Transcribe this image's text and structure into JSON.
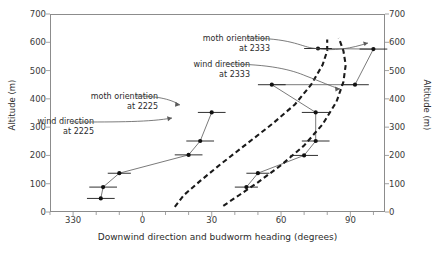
{
  "figure": {
    "clipped_header": "",
    "background": "#ffffff"
  },
  "axes": {
    "x": {
      "title": "Downwind direction and budworm heading (degrees)",
      "ticks": [
        "330",
        "0",
        "30",
        "60",
        "90"
      ],
      "tick_values": [
        -30,
        0,
        30,
        60,
        90
      ],
      "minor_step": 10,
      "min": -40,
      "max": 105
    },
    "y_left": {
      "title": "Altitude (m)",
      "ticks": [
        "0",
        "100",
        "200",
        "300",
        "400",
        "500",
        "600",
        "700"
      ],
      "tick_values": [
        0,
        100,
        200,
        300,
        400,
        500,
        600,
        700
      ],
      "min": 0,
      "max": 700
    },
    "y_right": {
      "title": "Altitude (m)",
      "ticks": [
        "0",
        "100",
        "200",
        "300",
        "400",
        "500",
        "600",
        "700"
      ],
      "tick_values": [
        0,
        100,
        200,
        300,
        400,
        500,
        600,
        700
      ],
      "min": 0,
      "max": 700
    }
  },
  "annotations": [
    {
      "name": "moth-orientation-2333",
      "line1": "moth orientation",
      "line2": "at 2333"
    },
    {
      "name": "wind-direction-2333",
      "line1": "wind direction",
      "line2": "at 2333"
    },
    {
      "name": "moth-orientation-2225",
      "line1": "moth orientation",
      "line2": "at 2225"
    },
    {
      "name": "wind-direction-2225",
      "line1": "wind direction",
      "line2": "at 2225"
    }
  ],
  "chart_data": {
    "type": "scatter",
    "title": "",
    "xlabel": "Downwind direction and budworm heading (degrees)",
    "ylabel": "Altitude (m)",
    "xlim": [
      -40,
      105
    ],
    "ylim": [
      0,
      700
    ],
    "xticks": [
      -30,
      0,
      30,
      60,
      90
    ],
    "xticklabels": [
      "330",
      "0",
      "30",
      "60",
      "90"
    ],
    "yticks": [
      0,
      100,
      200,
      300,
      400,
      500,
      600,
      700
    ],
    "grid": false,
    "legend": "annotations-inline",
    "series": [
      {
        "name": "moth orientation at 2225",
        "style": "markers-with-errorbars-and-thin-line",
        "marker": "filled-circle",
        "line": "solid-thin",
        "points": [
          {
            "x": -18,
            "y": 48,
            "xerr": 6
          },
          {
            "x": -17,
            "y": 88,
            "xerr": 6
          },
          {
            "x": -10,
            "y": 137,
            "xerr": 5
          },
          {
            "x": 20,
            "y": 202,
            "xerr": 6
          },
          {
            "x": 25,
            "y": 251,
            "xerr": 6
          },
          {
            "x": 30,
            "y": 352,
            "xerr": 6
          }
        ]
      },
      {
        "name": "moth orientation at 2333",
        "style": "markers-with-errorbars-and-thin-line",
        "marker": "filled-circle",
        "line": "solid-thin",
        "points": [
          {
            "x": 45,
            "y": 88,
            "xerr": 5
          },
          {
            "x": 50,
            "y": 137,
            "xerr": 5
          },
          {
            "x": 70,
            "y": 200,
            "xerr": 6
          },
          {
            "x": 75,
            "y": 251,
            "xerr": 6
          },
          {
            "x": 75,
            "y": 352,
            "xerr": 6
          },
          {
            "x": 56,
            "y": 450,
            "xerr": 6
          },
          {
            "x": 92,
            "y": 450,
            "xerr": 6
          },
          {
            "x": 76,
            "y": 578,
            "xerr": 6
          },
          {
            "x": 100,
            "y": 576,
            "xerr": 6
          }
        ]
      },
      {
        "name": "wind direction at 2225",
        "style": "dashed-curve",
        "line": "dashed-thick",
        "x": [
          14,
          18,
          25,
          34,
          45,
          56,
          66,
          73,
          78,
          80,
          80
        ],
        "y": [
          18,
          60,
          110,
          170,
          240,
          310,
          380,
          450,
          520,
          570,
          610
        ]
      },
      {
        "name": "wind direction at 2333",
        "style": "dashed-curve",
        "line": "dashed-thick",
        "x": [
          35,
          42,
          50,
          60,
          70,
          78,
          84,
          87,
          88,
          87,
          85
        ],
        "y": [
          22,
          60,
          105,
          165,
          235,
          310,
          390,
          460,
          520,
          570,
          615
        ]
      }
    ]
  }
}
